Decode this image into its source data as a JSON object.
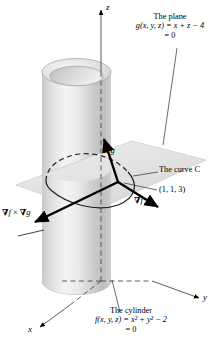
{
  "figure": {
    "title_plane_line1": "The plane",
    "title_plane_line2": "g(x, y, z) = x + z − 4",
    "title_plane_line3": "= 0",
    "title_cylinder_line1": "The cylinder",
    "title_cylinder_line2": "f(x, y, z) = x² + y² − 2",
    "title_cylinder_line3": "= 0",
    "curve_label": "The curve C",
    "point_label": "(1, 1, 3)",
    "axis_z": "z",
    "axis_y": "y",
    "axis_x": "x",
    "vector_grad_f": "∇f",
    "vector_grad_g": "∇g",
    "vector_cross": "∇f × ∇g",
    "colors": {
      "ink": "#000000",
      "cylinder_light": "#f2f2f2",
      "cylinder_mid": "#d8d8d8",
      "cylinder_dark": "#b9b9b9",
      "plane_fill": "#e3e3e3",
      "curve_stroke": "#2a2a2a",
      "axis_stroke": "#555555"
    }
  }
}
